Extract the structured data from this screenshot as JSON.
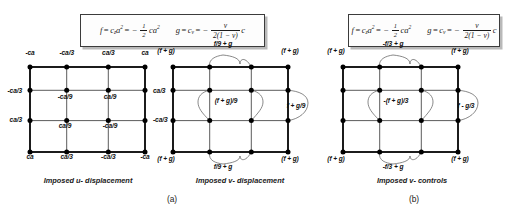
{
  "figure": {
    "panels": [
      {
        "id": "a",
        "letter": "(a)",
        "formula": {
          "f_expr": "f = c_z a^2 = -(1/2) ca^2",
          "g_expr": "g = c_v = - v / (2(1 - v)) c",
          "f_lhs": "f",
          "f_mid": "c",
          "f_mid_sub": "z",
          "f_mid_sup": "2",
          "f_var": "a",
          "f_half_num": "1",
          "f_half_den": "2",
          "f_tail": "ca",
          "f_tail_sup": "2",
          "g_lhs": "g",
          "g_mid": "c",
          "g_mid_sub": "v",
          "g_num": "v",
          "g_den": "2(1 − v)",
          "g_tail": "c"
        },
        "diagrams": [
          {
            "id": "u-displacement",
            "caption": "Imposed u- displacement",
            "labels": [
              {
                "text": "-ca",
                "x": 5,
                "y": -9,
                "align": "c"
              },
              {
                "text": "-ca/3",
                "x": 41.7,
                "y": -9,
                "align": "c"
              },
              {
                "text": "ca/3",
                "x": 83.3,
                "y": -9,
                "align": "c"
              },
              {
                "text": "ca",
                "x": 120,
                "y": -9,
                "align": "c"
              },
              {
                "text": "-ca/3",
                "x": -3,
                "y": 29,
                "align": "l"
              },
              {
                "text": "-ca/9",
                "x": 40,
                "y": 35,
                "align": "c"
              },
              {
                "text": "ca/9",
                "x": 85,
                "y": 35,
                "align": "c"
              },
              {
                "text": "ca/3",
                "x": 128,
                "y": 29,
                "align": "r"
              },
              {
                "text": "ca/3",
                "x": -3,
                "y": 58,
                "align": "l"
              },
              {
                "text": "ca/9",
                "x": 40,
                "y": 64,
                "align": "c"
              },
              {
                "text": "-ca/9",
                "x": 85,
                "y": 64,
                "align": "c"
              },
              {
                "text": "-ca/3",
                "x": 128,
                "y": 58,
                "align": "r"
              },
              {
                "text": "ca",
                "x": 5,
                "y": 95,
                "align": "c"
              },
              {
                "text": "ca/3",
                "x": 41.7,
                "y": 95,
                "align": "c"
              },
              {
                "text": "-ca/3",
                "x": 83.3,
                "y": 95,
                "align": "c"
              },
              {
                "text": "-ca",
                "x": 120,
                "y": 95,
                "align": "c"
              }
            ]
          },
          {
            "id": "v-displacement",
            "caption": "Imposed v- displacement",
            "labels": [
              {
                "text": "(f + g)",
                "x": -2,
                "y": -11,
                "align": "c"
              },
              {
                "text": "f/9 + g",
                "x": 55,
                "y": -18,
                "align": "c"
              },
              {
                "text": "(f + g)",
                "x": 122,
                "y": -11,
                "align": "c"
              },
              {
                "text": "(f + g)/9",
                "x": 58,
                "y": 39,
                "align": "c"
              },
              {
                "text": "f + g/9",
                "x": 128,
                "y": 44,
                "align": "c"
              },
              {
                "text": "(f + g)",
                "x": -2,
                "y": 97,
                "align": "c"
              },
              {
                "text": "f/9 + g",
                "x": 55,
                "y": 105,
                "align": "c"
              },
              {
                "text": "(f + g)",
                "x": 122,
                "y": 97,
                "align": "c"
              }
            ]
          }
        ]
      },
      {
        "id": "b",
        "letter": "(b)",
        "formula": {
          "f_expr": "f = c_z a^2 = -(1/2) ca^2",
          "g_expr": "g = c_v = - v / (2(1 - v)) c",
          "f_lhs": "f",
          "f_mid": "c",
          "f_mid_sub": "z",
          "f_mid_sup": "2",
          "f_var": "a",
          "f_half_num": "1",
          "f_half_den": "2",
          "f_tail": "ca",
          "f_tail_sup": "2",
          "g_lhs": "g",
          "g_mid": "c",
          "g_mid_sub": "v",
          "g_num": "v",
          "g_den": "2(1 − v)",
          "g_tail": "c"
        },
        "diagrams": [
          {
            "id": "v-controls",
            "caption": "Imposed v- controls",
            "labels": [
              {
                "text": "(f + g)",
                "x": -2,
                "y": -11,
                "align": "c"
              },
              {
                "text": "-f/3 + g",
                "x": 55,
                "y": -18,
                "align": "c"
              },
              {
                "text": "(f + g)",
                "x": 122,
                "y": -11,
                "align": "c"
              },
              {
                "text": "-(f + g)/3",
                "x": 58,
                "y": 39,
                "align": "c"
              },
              {
                "text": "f - g/3",
                "x": 128,
                "y": 44,
                "align": "c"
              },
              {
                "text": "(f + g)",
                "x": -2,
                "y": 97,
                "align": "c"
              },
              {
                "text": "-f/3 + g",
                "x": 55,
                "y": 105,
                "align": "c"
              },
              {
                "text": "(f + g)",
                "x": 122,
                "y": 97,
                "align": "c"
              }
            ]
          }
        ]
      }
    ],
    "colors": {
      "ink": "#111111",
      "node": "#000000",
      "box_border": "#3b3b3b",
      "box_shadow": "#b9b9b9",
      "background": "#ffffff",
      "thin_line": "#4a4a4a"
    }
  }
}
